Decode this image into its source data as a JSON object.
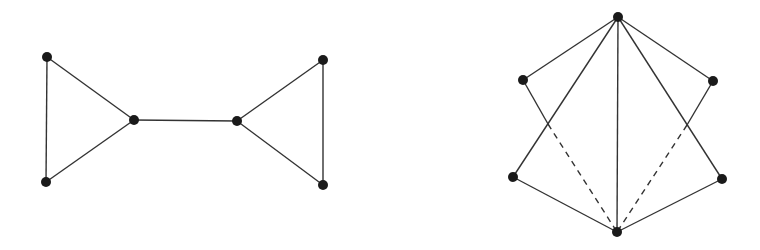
{
  "diagram": {
    "graphs": [
      {
        "name": "bowtie-graph",
        "nodes": [
          {
            "id": "a",
            "x": 47,
            "y": 57
          },
          {
            "id": "b",
            "x": 46,
            "y": 182
          },
          {
            "id": "c",
            "x": 134,
            "y": 120
          },
          {
            "id": "d",
            "x": 237,
            "y": 121
          },
          {
            "id": "e",
            "x": 323,
            "y": 60
          },
          {
            "id": "f",
            "x": 323,
            "y": 185
          }
        ],
        "edges": [
          {
            "from": "a",
            "to": "b",
            "style": "solid"
          },
          {
            "from": "a",
            "to": "c",
            "style": "solid"
          },
          {
            "from": "b",
            "to": "c",
            "style": "solid"
          },
          {
            "from": "c",
            "to": "d",
            "style": "solid"
          },
          {
            "from": "d",
            "to": "e",
            "style": "solid"
          },
          {
            "from": "d",
            "to": "f",
            "style": "solid"
          },
          {
            "from": "e",
            "to": "f",
            "style": "solid"
          }
        ]
      },
      {
        "name": "fan-graph",
        "nodes": [
          {
            "id": "t",
            "x": 618,
            "y": 17
          },
          {
            "id": "ul",
            "x": 523,
            "y": 80
          },
          {
            "id": "ur",
            "x": 713,
            "y": 81
          },
          {
            "id": "ll",
            "x": 513,
            "y": 177
          },
          {
            "id": "lr",
            "x": 722,
            "y": 179
          },
          {
            "id": "bt",
            "x": 617,
            "y": 232
          }
        ],
        "edges": [
          {
            "from": "t",
            "to": "ul",
            "style": "solid"
          },
          {
            "from": "t",
            "to": "ur",
            "style": "solid"
          },
          {
            "from": "t",
            "to": "ll",
            "style": "solid"
          },
          {
            "from": "t",
            "to": "lr",
            "style": "solid"
          },
          {
            "from": "t",
            "to": "bt",
            "style": "solid"
          },
          {
            "from": "ll",
            "to": "bt",
            "style": "solid"
          },
          {
            "from": "lr",
            "to": "bt",
            "style": "solid"
          },
          {
            "from": "ul",
            "to": "bt",
            "style": "partial-dashed",
            "solid_until": [
              548,
              124
            ]
          },
          {
            "from": "ur",
            "to": "bt",
            "style": "partial-dashed",
            "solid_until": [
              687,
              125
            ]
          }
        ]
      }
    ],
    "colors": {
      "edge": "#333333",
      "node": "#1a1a1a",
      "background": "#ffffff"
    }
  }
}
